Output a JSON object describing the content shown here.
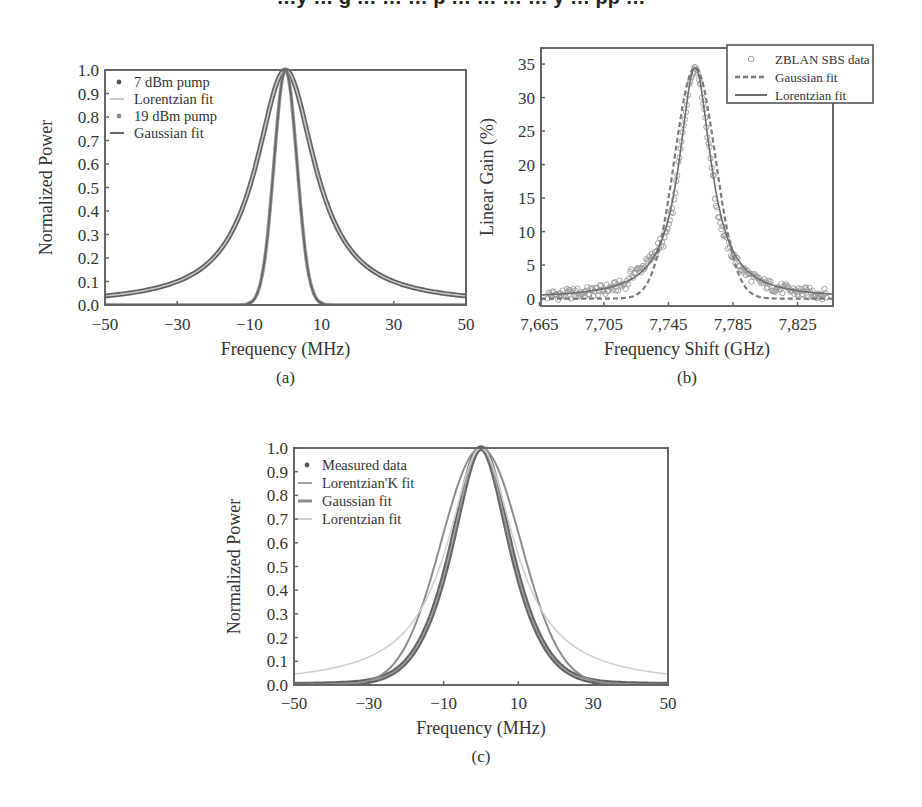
{
  "page": {
    "cut_header_text": "…y … g … … … p … … … … y … pp …"
  },
  "chart_data": [
    {
      "id": "a",
      "type": "line",
      "caption": "(a)",
      "title": "",
      "xlabel": "Frequency (MHz)",
      "ylabel": "Normalized Power",
      "xlim": [
        -50,
        50
      ],
      "ylim": [
        0.0,
        1.0
      ],
      "xticks": [
        -50,
        -30,
        -10,
        10,
        30,
        50
      ],
      "xtick_labels": [
        "−50",
        "−30",
        "−10",
        "10",
        "30",
        "50"
      ],
      "yticks": [
        0.0,
        0.1,
        0.2,
        0.3,
        0.4,
        0.5,
        0.6,
        0.7,
        0.8,
        0.9,
        1.0
      ],
      "ytick_labels": [
        "0.0",
        "0.1",
        "0.2",
        "0.3",
        "0.4",
        "0.5",
        "0.6",
        "0.7",
        "0.8",
        "0.9",
        "1.0"
      ],
      "grid": false,
      "legend_position": "top-left",
      "series": [
        {
          "name": "7 dBm pump",
          "kind": "markers",
          "color": "#555555",
          "model": "lorentzian",
          "center": 0,
          "fwhm": 20,
          "peak": 1.0,
          "x": [
            -50,
            -40,
            -30,
            -20,
            -10,
            -5,
            0,
            5,
            10,
            20,
            30,
            40,
            50
          ],
          "y": [
            0.04,
            0.06,
            0.1,
            0.2,
            0.5,
            0.8,
            1.0,
            0.8,
            0.5,
            0.2,
            0.1,
            0.06,
            0.04
          ]
        },
        {
          "name": "Lorentzian fit",
          "kind": "line",
          "color": "#c8c8c8",
          "model": "lorentzian",
          "center": 0,
          "fwhm": 20,
          "peak": 1.0
        },
        {
          "name": "19 dBm pump",
          "kind": "markers",
          "color": "#8a8a8a",
          "model": "gaussian",
          "center": 0,
          "fwhm": 7.5,
          "peak": 1.0,
          "x": [
            -50,
            -12,
            -8,
            -5,
            -3,
            0,
            3,
            5,
            8,
            12,
            50
          ],
          "y": [
            0.0,
            0.01,
            0.11,
            0.41,
            0.72,
            1.0,
            0.72,
            0.41,
            0.11,
            0.01,
            0.0
          ]
        },
        {
          "name": "Gaussian fit",
          "kind": "line",
          "color": "#666666",
          "model": "gaussian",
          "center": 0,
          "fwhm": 7.5,
          "peak": 1.0
        }
      ]
    },
    {
      "id": "b",
      "type": "line",
      "caption": "(b)",
      "title": "",
      "xlabel": "Frequency Shift (GHz)",
      "ylabel": "Linear Gain (%)",
      "xlim": [
        7666,
        7847
      ],
      "ylim": [
        -1.1,
        37.4
      ],
      "xticks": [
        7665,
        7705,
        7745,
        7785,
        7825
      ],
      "xtick_labels": [
        "7,665",
        "7,705",
        "7,745",
        "7,785",
        "7,825"
      ],
      "yticks": [
        0,
        5,
        10,
        15,
        20,
        25,
        30,
        35
      ],
      "ytick_labels": [
        "0",
        "5",
        "10",
        "15",
        "20",
        "25",
        "30",
        "35"
      ],
      "grid": false,
      "legend_position": "top-right (outside)",
      "series": [
        {
          "name": "ZBLAN SBS data",
          "kind": "circles",
          "color": "#9a9a9a",
          "model": "lorentzian",
          "center": 7761.5,
          "fwhm": 24,
          "peak": 34.5,
          "offset": -0.6,
          "x": [
            7670,
            7690,
            7710,
            7730,
            7745,
            7755,
            7761.5,
            7770,
            7780,
            7795,
            7815,
            7840
          ],
          "y": [
            0.8,
            2.2,
            4.5,
            9.5,
            19.0,
            31.0,
            34.5,
            28.0,
            15.5,
            5.5,
            2.0,
            0.5
          ]
        },
        {
          "name": "Gaussian fit",
          "kind": "dashed",
          "color": "#7a7a7a",
          "model": "gaussian",
          "center": 7761.5,
          "fwhm": 30,
          "peak": 34.5
        },
        {
          "name": "Lorentzian fit",
          "kind": "line",
          "color": "#6e6e6e",
          "model": "lorentzian",
          "center": 7761.5,
          "fwhm": 24,
          "peak": 34.5
        }
      ]
    },
    {
      "id": "c",
      "type": "line",
      "caption": "(c)",
      "title": "",
      "xlabel": "Frequency (MHz)",
      "ylabel": "Normalized Power",
      "xlim": [
        -50,
        50
      ],
      "ylim": [
        0.0,
        1.0
      ],
      "xticks": [
        -50,
        -30,
        -10,
        10,
        30,
        50
      ],
      "xtick_labels": [
        "−50",
        "−30",
        "−10",
        "10",
        "30",
        "50"
      ],
      "yticks": [
        0.0,
        0.1,
        0.2,
        0.3,
        0.4,
        0.5,
        0.6,
        0.7,
        0.8,
        0.9,
        1.0
      ],
      "ytick_labels": [
        "0.0",
        "0.1",
        "0.2",
        "0.3",
        "0.4",
        "0.5",
        "0.6",
        "0.7",
        "0.8",
        "0.9",
        "1.0"
      ],
      "grid": false,
      "legend_position": "top-left",
      "series": [
        {
          "name": "Measured data",
          "kind": "markers",
          "color": "#555555",
          "model": "lorentzianK",
          "center": 0,
          "fwhm": 24,
          "peak": 1.0,
          "k": 0.6,
          "x": [
            -50,
            -40,
            -30,
            -20,
            -12,
            -6,
            0,
            6,
            12,
            20,
            30,
            40,
            50
          ],
          "y": [
            0.03,
            0.05,
            0.09,
            0.25,
            0.5,
            0.85,
            1.0,
            0.85,
            0.5,
            0.25,
            0.09,
            0.05,
            0.03
          ]
        },
        {
          "name": "Lorentzian'K fit",
          "kind": "line",
          "color": "#a0a0a0",
          "model": "lorentzianK",
          "center": 0,
          "fwhm": 24,
          "peak": 1.0,
          "k": 0.6
        },
        {
          "name": "Gaussian fit",
          "kind": "line",
          "color": "#8c8c8c",
          "model": "gaussian",
          "center": 0,
          "fwhm": 25,
          "peak": 1.0
        },
        {
          "name": "Lorentzian fit",
          "kind": "line",
          "color": "#d0d0d0",
          "model": "lorentzian",
          "center": 0,
          "fwhm": 22,
          "peak": 1.0
        }
      ]
    }
  ]
}
